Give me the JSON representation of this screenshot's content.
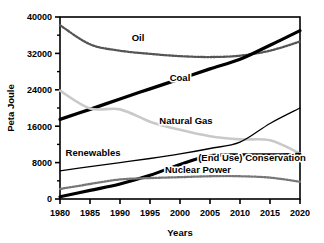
{
  "chart_data": {
    "type": "line",
    "title": "",
    "xlabel": "Years",
    "ylabel": "Peta Joule",
    "xlim": [
      1980,
      2020
    ],
    "ylim": [
      0,
      40000
    ],
    "xticks": [
      "1980",
      "1985",
      "1990",
      "1995",
      "2000",
      "2005",
      "2010",
      "2015",
      "2020"
    ],
    "yticks": [
      "0",
      "8000",
      "16000",
      "24000",
      "32000",
      "40000"
    ],
    "y_minor_interval": 4000,
    "grid": false,
    "legend_position": "inline-annotations",
    "x": [
      1980,
      1985,
      1990,
      1995,
      2000,
      2005,
      2010,
      2015,
      2020
    ],
    "series": [
      {
        "name": "Oil",
        "style": "dotted",
        "color": "#555555",
        "label": "Oil",
        "values": [
          38200,
          34000,
          32600,
          31900,
          31400,
          31200,
          31500,
          32600,
          34600
        ]
      },
      {
        "name": "Coal",
        "style": "thick-solid",
        "color": "#000000",
        "label": "Coal",
        "values": [
          17500,
          19700,
          22000,
          24200,
          26400,
          28600,
          30700,
          33800,
          37000
        ]
      },
      {
        "name": "Natural Gas",
        "style": "solid-light",
        "color": "#c9c9c9",
        "label": "Natural Gas",
        "values": [
          23800,
          19900,
          19700,
          17000,
          15200,
          13800,
          13100,
          12900,
          10000
        ]
      },
      {
        "name": "Renewables",
        "style": "thin-solid",
        "color": "#000000",
        "label": "Renewables",
        "values": [
          6200,
          7100,
          8000,
          8900,
          9900,
          11100,
          12500,
          16600,
          20000
        ]
      },
      {
        "name": "(End Use) Conservation",
        "style": "thick-solid",
        "color": "#000000",
        "label": "(End Use) Conservation",
        "values": [
          500,
          1900,
          3300,
          5200,
          7600,
          9500,
          9700,
          9700,
          9800
        ]
      },
      {
        "name": "Nuclear Power",
        "style": "dotted",
        "color": "#777777",
        "label": "Nuclear Power",
        "values": [
          2200,
          3300,
          4300,
          4600,
          4800,
          5000,
          5000,
          4700,
          3800
        ]
      }
    ],
    "annotations": [
      {
        "text": "Oil",
        "x": 1993,
        "y": 34800
      },
      {
        "text": "Coal",
        "x": 2000,
        "y": 25900
      },
      {
        "text": "Natural Gas",
        "x": 2001,
        "y": 16500
      },
      {
        "text": "Renewables",
        "x": 1985.5,
        "y": 9400
      },
      {
        "text": "(End Use) Conservation",
        "x": 2012,
        "y": 8300
      },
      {
        "text": "Nuclear Power",
        "x": 2003,
        "y": 5800
      }
    ]
  }
}
